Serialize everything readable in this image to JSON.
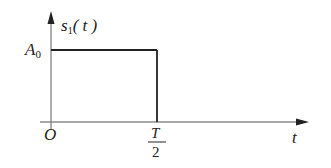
{
  "diagram": {
    "type": "signal-waveform",
    "y_axis": {
      "label_main": "s",
      "label_sub": "1",
      "label_arg": "( t )"
    },
    "x_axis": {
      "label": "t"
    },
    "origin_label": "O",
    "amplitude_label": {
      "main": "A",
      "sub": "0"
    },
    "pulse_end_label": {
      "numerator": "T",
      "denominator": "2"
    },
    "colors": {
      "line": "#222222",
      "axis": "#555555",
      "background": "#ffffff"
    }
  }
}
